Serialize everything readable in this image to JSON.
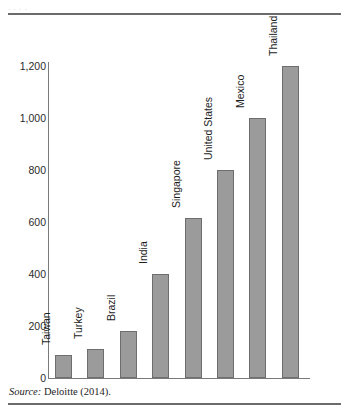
{
  "figure": {
    "source_label": "Source:",
    "source_text": "Deloitte (2014).",
    "ghost_text": "·      ·          ·      ·"
  },
  "chart_data": {
    "type": "bar",
    "title": "",
    "subtitle": "",
    "xlabel": "",
    "ylabel": "",
    "ylim": [
      0,
      1200
    ],
    "yticks": [
      0,
      200,
      400,
      600,
      800,
      1000,
      1200
    ],
    "ytick_labels": [
      "0",
      "200",
      "400",
      "600",
      "800",
      "1,000",
      "1,200"
    ],
    "grid": false,
    "legend": null,
    "bar_color": "#9b9b9b",
    "bar_border_color": "#6e6e6e",
    "categories": [
      "Taiwan",
      "Turkey",
      "Brazil",
      "India",
      "Singapore",
      "United States",
      "Mexico",
      "Thailand"
    ],
    "values": [
      90,
      110,
      180,
      400,
      615,
      800,
      1000,
      1200
    ],
    "annotations": []
  }
}
